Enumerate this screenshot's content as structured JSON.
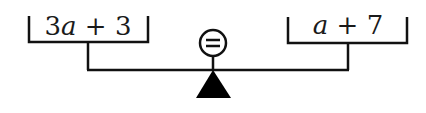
{
  "diagram": {
    "type": "balance-scale",
    "left_pan": {
      "coefficient": "3",
      "variable": "a",
      "operator": " + ",
      "constant": "3",
      "expression": "3a + 3"
    },
    "right_pan": {
      "variable": "a",
      "operator": " + ",
      "constant": "7",
      "expression": "a + 7"
    },
    "indicator": {
      "symbol": "=",
      "icon": "equals-circle-icon"
    },
    "fulcrum": {
      "icon": "triangle-fulcrum-icon"
    },
    "colors": {
      "line": "#111111",
      "background": "#ffffff"
    }
  }
}
